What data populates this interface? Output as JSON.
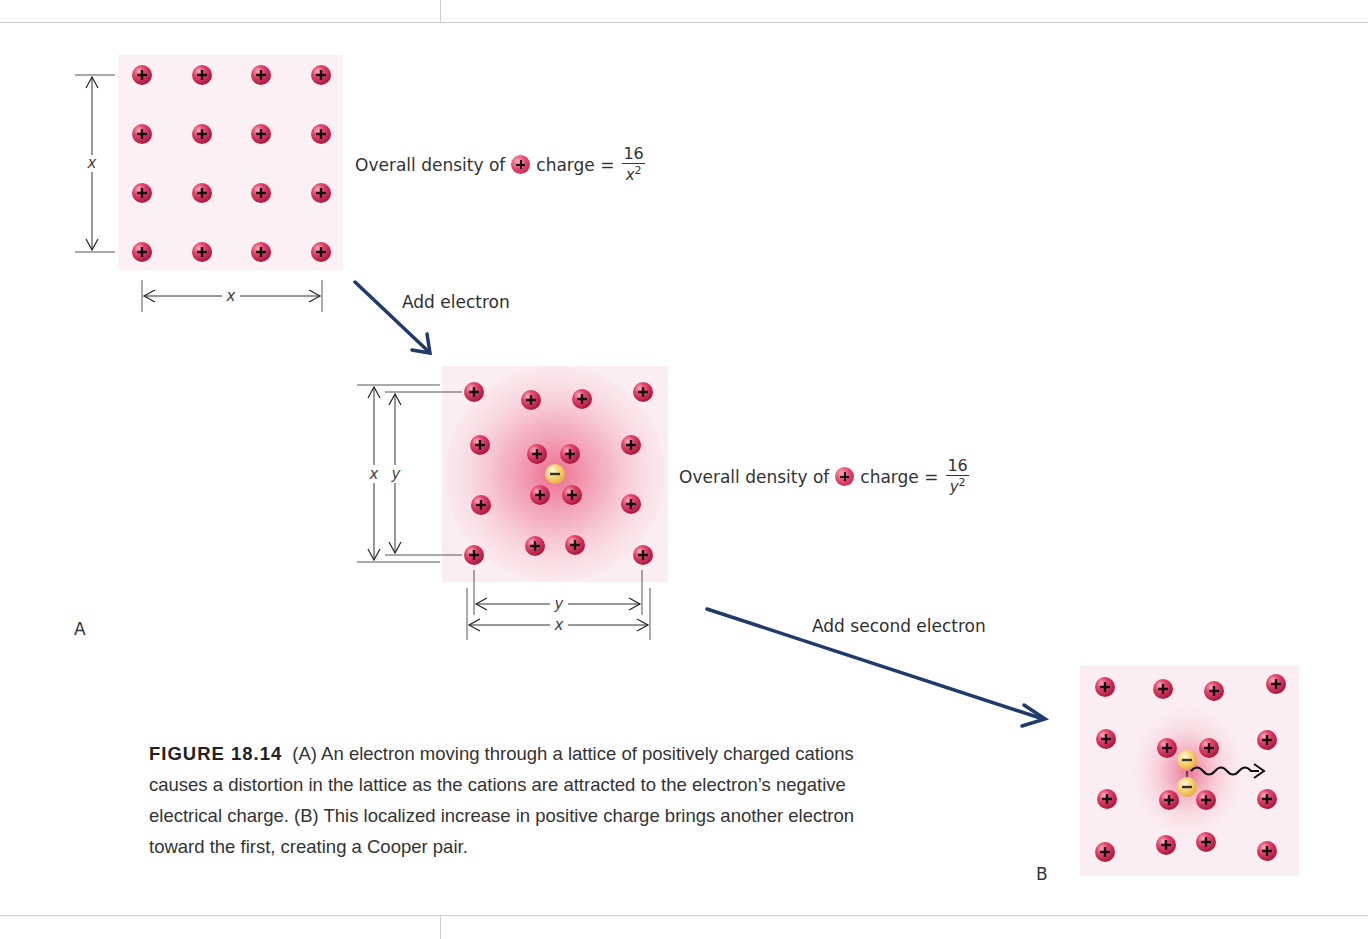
{
  "page": {
    "background": "#ffffff",
    "rule_color": "#cfcfcf"
  },
  "colors": {
    "cation": "#e0406a",
    "cation_dark": "#b81c45",
    "electron": "#f5c96a",
    "arrow": "#1f3a6b",
    "lattice_tint": "#fbeef2",
    "distortion_glow": "#e8557c"
  },
  "panel_a": {
    "letter": "A",
    "lattice_label_side": "x",
    "lattice_label_bottom": "x",
    "density_text_prefix": "Overall density of",
    "density_text_suffix": "charge =",
    "density_numerator": "16",
    "density_denominator_var": "x",
    "density_denominator_exp": "2",
    "cation_grid": "4x4"
  },
  "arrow_1": {
    "label": "Add electron"
  },
  "panel_middle": {
    "outer_label": "x",
    "inner_label": "y",
    "bottom_inner_label": "y",
    "bottom_outer_label": "x",
    "density_text_prefix": "Overall density of",
    "density_text_suffix": "charge =",
    "density_numerator": "16",
    "density_denominator_var": "y",
    "density_denominator_exp": "2",
    "electron_symbol": "−",
    "cation_count": 16
  },
  "arrow_2": {
    "label": "Add second electron"
  },
  "panel_b": {
    "letter": "B",
    "electron_symbol": "−",
    "electron_count": 2,
    "cation_count": 16,
    "motion_arrow": "wavy-arrow-right"
  },
  "caption": {
    "figure_label": "FIGURE 18.14",
    "text": "(A) An electron moving through a lattice of positively charged cations causes a distortion in the lattice as the cations are attracted to the electron’s negative electrical charge. (B) This localized increase in positive charge brings another electron toward the first, creating a Cooper pair."
  }
}
